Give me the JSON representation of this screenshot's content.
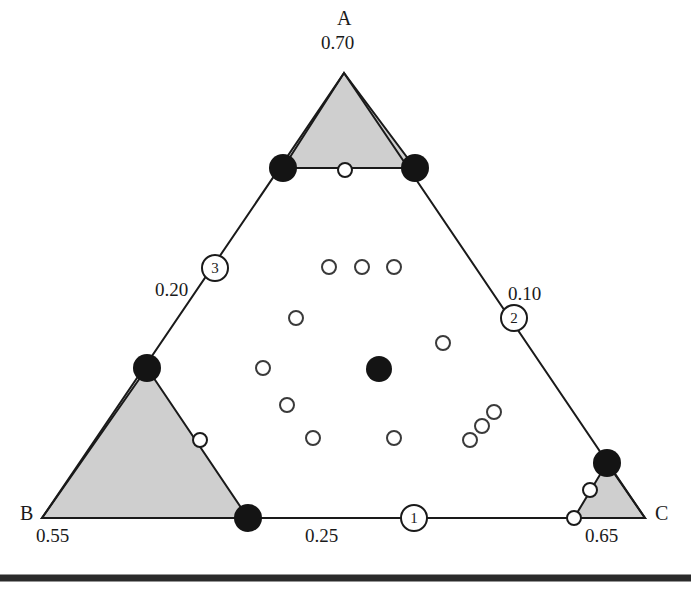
{
  "figure": {
    "type": "ternary-diagram",
    "caption_rule": true,
    "vertices": [
      {
        "id": "A",
        "letter": "A",
        "value": "0.70",
        "x": 344,
        "y": 73,
        "letter_x": 337,
        "letter_y": 17,
        "value_x": 321,
        "value_y": 40
      },
      {
        "id": "B",
        "letter": "B",
        "value": "0.55",
        "x": 42,
        "y": 518,
        "letter_x": 22,
        "letter_y": 505,
        "value_x": 36,
        "value_y": 529
      },
      {
        "id": "C",
        "letter": "C",
        "value": "0.65",
        "x": 645,
        "y": 518,
        "letter_x": 655,
        "letter_y": 505,
        "value_x": 585,
        "value_y": 529
      }
    ],
    "edge_markers": [
      {
        "number": "1",
        "edge": "bottom-BC",
        "x": 414,
        "y": 518,
        "value": "0.25",
        "value_x": 305,
        "value_y": 529
      },
      {
        "number": "2",
        "edge": "right-AC",
        "x": 514,
        "y": 318,
        "value": "0.10",
        "value_x": 508,
        "value_y": 287
      },
      {
        "number": "3",
        "edge": "left-AB",
        "x": 215,
        "y": 268,
        "value": "0.20",
        "value_x": 155,
        "value_y": 283
      }
    ],
    "shaded_regions": [
      {
        "name": "apex-A-subtriangle",
        "points": "344,73 283,168 415,168"
      },
      {
        "name": "corner-B-subtriangle",
        "points": "147,368 248,518 42,518"
      },
      {
        "name": "corner-C-subtriangle",
        "points": "607,463 645,518 574,518"
      }
    ],
    "filled_points": [
      {
        "name": "vertex-dot-apex-left",
        "x": 283,
        "y": 168,
        "r": 14
      },
      {
        "name": "vertex-dot-apex-right",
        "x": 415,
        "y": 168,
        "r": 14
      },
      {
        "name": "vertex-dot-left-edge",
        "x": 147,
        "y": 368,
        "r": 14
      },
      {
        "name": "vertex-dot-baseline",
        "x": 248,
        "y": 518,
        "r": 14
      },
      {
        "name": "vertex-dot-right-corner",
        "x": 607,
        "y": 463,
        "r": 14
      },
      {
        "name": "centroid-dot",
        "x": 379,
        "y": 369,
        "r": 13
      }
    ],
    "open_points": [
      {
        "name": "open-apex-base-mid",
        "x": 345,
        "y": 170,
        "r": 7
      },
      {
        "name": "open-b-hypotenuse",
        "x": 200,
        "y": 440,
        "r": 7
      },
      {
        "name": "open-c-upper",
        "x": 590,
        "y": 490,
        "r": 7
      },
      {
        "name": "open-c-lower",
        "x": 574,
        "y": 518,
        "r": 7
      },
      {
        "name": "open-interior-1",
        "x": 329,
        "y": 267,
        "r": 7
      },
      {
        "name": "open-interior-2",
        "x": 362,
        "y": 267,
        "r": 7
      },
      {
        "name": "open-interior-3",
        "x": 394,
        "y": 267,
        "r": 7
      },
      {
        "name": "open-interior-4",
        "x": 296,
        "y": 318,
        "r": 7
      },
      {
        "name": "open-interior-5",
        "x": 443,
        "y": 343,
        "r": 7
      },
      {
        "name": "open-interior-6",
        "x": 263,
        "y": 368,
        "r": 7
      },
      {
        "name": "open-interior-7",
        "x": 287,
        "y": 405,
        "r": 7
      },
      {
        "name": "open-interior-8",
        "x": 313,
        "y": 438,
        "r": 7
      },
      {
        "name": "open-interior-9",
        "x": 394,
        "y": 438,
        "r": 7
      },
      {
        "name": "open-cluster-1",
        "x": 470,
        "y": 440,
        "r": 7
      },
      {
        "name": "open-cluster-2",
        "x": 482,
        "y": 426,
        "r": 7
      },
      {
        "name": "open-cluster-3",
        "x": 494,
        "y": 412,
        "r": 7
      }
    ],
    "colors": {
      "line": "#1a1a1a",
      "shade_fill": "#cfcfcf",
      "dot_fill": "#141414",
      "open_fill": "#ffffff",
      "rule": "#2b2b2b",
      "text": "#1a1a1a"
    }
  }
}
